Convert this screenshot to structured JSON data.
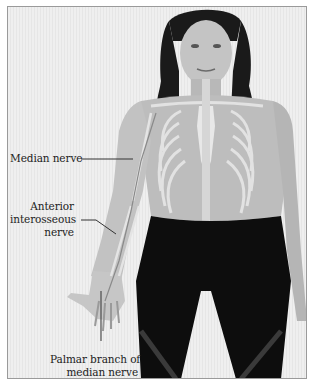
{
  "figure": {
    "labels": [
      {
        "id": "median-nerve",
        "text": "Median nerve"
      },
      {
        "id": "anterior-interosseous-nerve",
        "lines": [
          "Anterior",
          "interosseous",
          "nerve"
        ]
      },
      {
        "id": "palmar-branch",
        "lines": [
          "Palmar branch of",
          "median nerve"
        ]
      }
    ],
    "colors": {
      "background": "#ebebeb",
      "border": "#9a9a9a",
      "text": "#222222",
      "leader_line": "#333333",
      "leggings": "#0d0d0d",
      "hair": "#1a1a1a",
      "skin": "#b8b8b8",
      "bone": "#dcdcdc"
    }
  }
}
